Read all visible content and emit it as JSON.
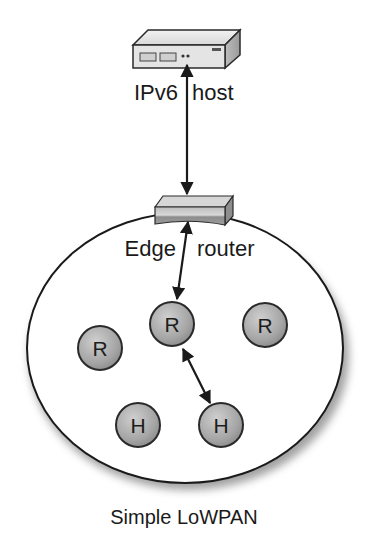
{
  "diagram": {
    "title": "Simple LoWPAN",
    "host": {
      "label_left": "IPv6",
      "label_right": "host"
    },
    "edge_router": {
      "label_left": "Edge",
      "label_right": "router"
    },
    "network_label": "Simple LoWPAN",
    "nodes": [
      {
        "id": "r-center",
        "label": "R",
        "type": "router",
        "x": 172,
        "y": 324
      },
      {
        "id": "r-left",
        "label": "R",
        "type": "router",
        "x": 100,
        "y": 348
      },
      {
        "id": "r-right",
        "label": "R",
        "type": "router",
        "x": 265,
        "y": 325
      },
      {
        "id": "h-left",
        "label": "H",
        "type": "host",
        "x": 138,
        "y": 425
      },
      {
        "id": "h-right",
        "label": "H",
        "type": "host",
        "x": 221,
        "y": 425
      }
    ],
    "links": [
      {
        "from": "IPv6 host",
        "to": "Edge router",
        "bidirectional": true
      },
      {
        "from": "Edge router",
        "to": "R (center)",
        "bidirectional": true
      },
      {
        "from": "R (center)",
        "to": "H (right)",
        "bidirectional": true
      }
    ],
    "colors": {
      "node_fill": "#a9a9a9",
      "node_stroke": "#2a2a2a",
      "outline": "#1a1a1a",
      "background": "#ffffff"
    }
  }
}
